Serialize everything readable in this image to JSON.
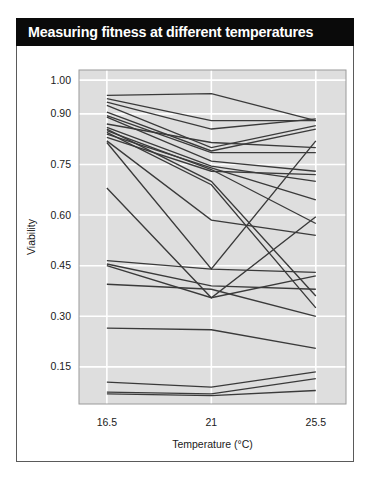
{
  "figure": {
    "title": "Measuring fitness at different temperatures",
    "title_background": "#0a0a0a",
    "title_color": "#ffffff",
    "frame_border_color": "#5a5a5a"
  },
  "chart_data": {
    "type": "line",
    "title": "Measuring fitness at different temperatures",
    "xlabel": "Temperature (°C)",
    "ylabel": "Viability",
    "x": [
      16.5,
      21,
      25.5
    ],
    "xtick_labels": [
      "16.5",
      "21",
      "25.5"
    ],
    "ytick_values": [
      1.0,
      0.9,
      0.75,
      0.6,
      0.45,
      0.3,
      0.15
    ],
    "ytick_labels": [
      "1.00",
      "0.90",
      "0.75",
      "0.60",
      "0.45",
      "0.30",
      "0.15"
    ],
    "xlim": [
      15.3,
      26.8
    ],
    "ylim": [
      0.04,
      1.03
    ],
    "grid": "horizontal-and-vertical-white-on-grey-panel",
    "panel_color": "#dedede",
    "line_color": "#3a3a3a",
    "legend": "none",
    "series": [
      {
        "name": "strain-01",
        "values": [
          0.955,
          0.96,
          0.88
        ]
      },
      {
        "name": "strain-02",
        "values": [
          0.945,
          0.88,
          0.88
        ]
      },
      {
        "name": "strain-03",
        "values": [
          0.935,
          0.855,
          0.885
        ]
      },
      {
        "name": "strain-04",
        "values": [
          0.925,
          0.8,
          0.865
        ]
      },
      {
        "name": "strain-05",
        "values": [
          0.905,
          0.79,
          0.855
        ]
      },
      {
        "name": "strain-06",
        "values": [
          0.895,
          0.785,
          0.785
        ]
      },
      {
        "name": "strain-07",
        "values": [
          0.89,
          0.76,
          0.73
        ]
      },
      {
        "name": "strain-08",
        "values": [
          0.87,
          0.815,
          0.8
        ]
      },
      {
        "name": "strain-09",
        "values": [
          0.86,
          0.745,
          0.7
        ]
      },
      {
        "name": "strain-10",
        "values": [
          0.855,
          0.7,
          0.36
        ]
      },
      {
        "name": "strain-11",
        "values": [
          0.85,
          0.735,
          0.575
        ]
      },
      {
        "name": "strain-12",
        "values": [
          0.845,
          0.69,
          0.325
        ]
      },
      {
        "name": "strain-13",
        "values": [
          0.84,
          0.74,
          0.645
        ]
      },
      {
        "name": "strain-14",
        "values": [
          0.83,
          0.73,
          0.72
        ]
      },
      {
        "name": "strain-15",
        "values": [
          0.82,
          0.585,
          0.54
        ]
      },
      {
        "name": "strain-16",
        "values": [
          0.815,
          0.44,
          0.82
        ]
      },
      {
        "name": "strain-17",
        "values": [
          0.68,
          0.355,
          0.595
        ]
      },
      {
        "name": "strain-18",
        "values": [
          0.465,
          0.44,
          0.43
        ]
      },
      {
        "name": "strain-19",
        "values": [
          0.455,
          0.39,
          0.38
        ]
      },
      {
        "name": "strain-20",
        "values": [
          0.45,
          0.355,
          0.42
        ]
      },
      {
        "name": "strain-21",
        "values": [
          0.395,
          0.38,
          0.3
        ]
      },
      {
        "name": "strain-22",
        "values": [
          0.265,
          0.26,
          0.205
        ]
      },
      {
        "name": "strain-23",
        "values": [
          0.105,
          0.09,
          0.135
        ]
      },
      {
        "name": "strain-24",
        "values": [
          0.075,
          0.07,
          0.115
        ]
      },
      {
        "name": "strain-25",
        "values": [
          0.07,
          0.065,
          0.08
        ]
      }
    ]
  }
}
